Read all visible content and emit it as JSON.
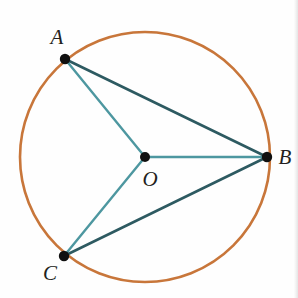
{
  "figure": {
    "kind": "circle-geometry-diagram",
    "canvas": {
      "width": 298,
      "height": 298,
      "background": "#fefefe"
    },
    "circle": {
      "name": "circle-O",
      "center": {
        "x": 145,
        "y": 157
      },
      "radius": 125,
      "stroke_color": "#c8763a",
      "stroke_width": 2.6
    },
    "points": [
      {
        "id": "A",
        "label": "A",
        "x": 65,
        "y": 59,
        "label_x": 57,
        "label_y": 44,
        "dot_radius": 5.2,
        "on_circle": true
      },
      {
        "id": "B",
        "label": "B",
        "x": 267,
        "y": 157,
        "label_x": 285,
        "label_y": 164,
        "dot_radius": 5.2,
        "on_circle": true
      },
      {
        "id": "C",
        "label": "C",
        "x": 64,
        "y": 256,
        "label_x": 50,
        "label_y": 280,
        "dot_radius": 5.2,
        "on_circle": true
      },
      {
        "id": "O",
        "label": "O",
        "x": 145,
        "y": 157,
        "label_x": 150,
        "label_y": 186,
        "dot_radius": 5.0,
        "on_circle": false
      }
    ],
    "segments": [
      {
        "id": "OA",
        "from": "O",
        "to": "A",
        "role": "radius",
        "color": "#4d97a0",
        "width": 2.4
      },
      {
        "id": "OB",
        "from": "O",
        "to": "B",
        "role": "radius",
        "color": "#4d97a0",
        "width": 2.4
      },
      {
        "id": "OC",
        "from": "O",
        "to": "C",
        "role": "radius",
        "color": "#4d97a0",
        "width": 2.4
      },
      {
        "id": "AB",
        "from": "A",
        "to": "B",
        "role": "chord",
        "color": "#2d5a61",
        "width": 2.6
      },
      {
        "id": "CB",
        "from": "C",
        "to": "B",
        "role": "chord",
        "color": "#2d5a61",
        "width": 2.6
      }
    ],
    "label_font_size": 21,
    "colors": {
      "circle_orange": "#c8763a",
      "radius_teal": "#4d97a0",
      "chord_dark_teal": "#2d5a61",
      "vertex_black": "#101010",
      "label_text": "#231f20"
    }
  }
}
